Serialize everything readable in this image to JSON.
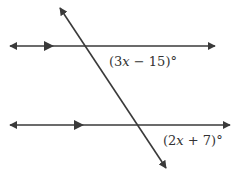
{
  "diagram": {
    "type": "parallel-lines-transversal",
    "line_color": "#3a3a3a",
    "top_line": {
      "y": 46,
      "x1": 10,
      "x2": 215,
      "parallel_mark_x": 50
    },
    "bottom_line": {
      "y": 125,
      "x1": 10,
      "x2": 230,
      "parallel_mark_x": 80
    },
    "transversal": {
      "x1": 60,
      "y1": 8,
      "x2": 166,
      "y2": 168
    },
    "angles": [
      {
        "id": "top",
        "prefix": "(3",
        "var": "x",
        "suffix": " − 15)°",
        "full": "(3x − 15)°"
      },
      {
        "id": "bottom",
        "prefix": "(2",
        "var": "x",
        "suffix": " + 7)°",
        "full": "(2x + 7)°"
      }
    ]
  }
}
